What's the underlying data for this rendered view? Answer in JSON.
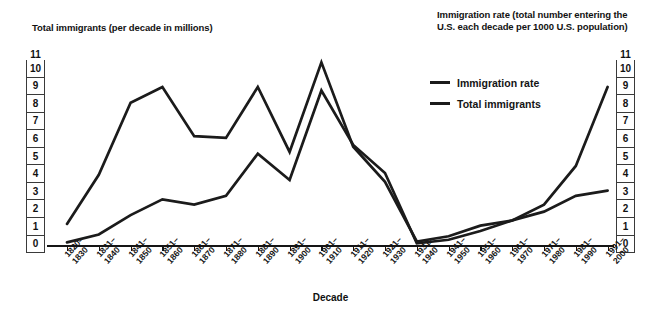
{
  "left_axis_title": "Total immigrants (per decade in millions)",
  "right_axis_title": "Immigration rate (total number entering the\nU.S. each decade per 1000 U.S. population)",
  "xaxis_label": "Decade",
  "y_ticks": [
    "11",
    "10",
    "9",
    "8",
    "7",
    "6",
    "5",
    "4",
    "3",
    "2",
    "1",
    "0"
  ],
  "legend": {
    "position": "upper-right-inside",
    "items": [
      {
        "label": "Immigration rate",
        "color": "#1b1b1b"
      },
      {
        "label": "Total immigrants",
        "color": "#1b1b1b"
      }
    ]
  },
  "chart_data": {
    "type": "line",
    "title": "",
    "subtitle": "",
    "xlabel": "Decade",
    "ylabel": "Total immigrants (per decade in millions)",
    "ylabel_right": "Immigration rate (total number entering the U.S. each decade per 1000 U.S. population)",
    "grid": false,
    "ylim": [
      0,
      11
    ],
    "y_ticks": [
      0,
      1,
      2,
      3,
      4,
      5,
      6,
      7,
      8,
      9,
      10,
      11
    ],
    "categories": [
      "1820–\n1830",
      "1831–\n1840",
      "1841–\n1850",
      "1851–\n1860",
      "1861–\n1870",
      "1871–\n1880",
      "1881–\n1890",
      "1891–\n1900",
      "1901–\n1910",
      "1911–\n1920",
      "1921–\n1930",
      "1931–\n1940",
      "1941–\n1950",
      "1951–\n1960",
      "1961–\n1970",
      "1971–\n1980",
      "1981–\n1990",
      "1991–\n2000"
    ],
    "series": [
      {
        "name": "Immigration rate",
        "color": "#1b1b1b",
        "values": [
          1.2,
          4.0,
          8.1,
          9.0,
          6.2,
          6.1,
          9.0,
          5.3,
          10.4,
          5.6,
          3.6,
          0.2,
          0.5,
          1.1,
          1.4,
          1.9,
          2.8,
          3.1
        ]
      },
      {
        "name": "Total immigrants",
        "color": "#1b1b1b",
        "values": [
          0.15,
          0.6,
          1.7,
          2.6,
          2.3,
          2.8,
          5.2,
          3.7,
          8.8,
          5.7,
          4.1,
          0.1,
          0.3,
          0.8,
          1.4,
          2.3,
          4.5,
          9.0
        ]
      }
    ]
  }
}
